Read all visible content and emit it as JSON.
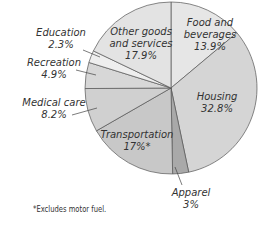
{
  "chart_data": {
    "type": "pie",
    "title": "",
    "start_angle_deg": 0,
    "direction": "clockwise",
    "slices": [
      {
        "name": "Food and beverages",
        "value": 13.9,
        "label_lines": [
          "Food and",
          "beverages",
          "13.9%"
        ],
        "color": "#e6e6e6"
      },
      {
        "name": "Housing",
        "value": 32.8,
        "label_lines": [
          "Housing",
          "32.8%"
        ],
        "color": "#d5d5d5"
      },
      {
        "name": "Apparel",
        "value": 3.0,
        "label_lines": [
          "Apparel",
          "3%"
        ],
        "color": "#a9a9a9"
      },
      {
        "name": "Transportation",
        "value": 17.0,
        "label_lines": [
          "Transportation",
          "17%*"
        ],
        "color": "#c8c8c8"
      },
      {
        "name": "Medical care",
        "value": 8.2,
        "label_lines": [
          "Medical care",
          "8.2%"
        ],
        "color": "#d0d0d0"
      },
      {
        "name": "Recreation",
        "value": 4.9,
        "label_lines": [
          "Recreation",
          "4.9%"
        ],
        "color": "#d7d7d7"
      },
      {
        "name": "Education",
        "value": 2.3,
        "label_lines": [
          "Education",
          "2.3%"
        ],
        "color": "#eeeeee"
      },
      {
        "name": "Other goods and services",
        "value": 17.9,
        "label_lines": [
          "Other goods",
          "and services",
          "17.9%"
        ],
        "color": "#e3e3e3"
      }
    ],
    "footnote": "*Excludes motor fuel."
  }
}
